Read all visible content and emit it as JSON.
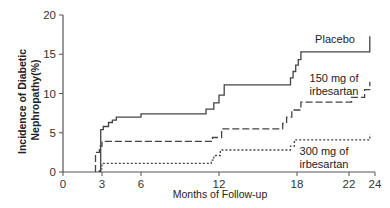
{
  "chart_data": {
    "type": "line",
    "subtype": "step (Kaplan-Meier cumulative incidence)",
    "title": "",
    "xlabel": "Months of Follow-up",
    "ylabel": [
      "Incidence of Diabetic",
      "Nephropathy(%)"
    ],
    "xlim": [
      0,
      24
    ],
    "ylim": [
      0,
      20
    ],
    "x_ticks": [
      0,
      3,
      6,
      12,
      18,
      22,
      24
    ],
    "y_ticks": [
      0,
      5,
      10,
      15,
      20
    ],
    "grid": false,
    "legend_position": "inline labels near curves",
    "series": [
      {
        "name": "Placebo",
        "style": "solid",
        "color": "#444444",
        "label_lines": [
          "Placebo"
        ],
        "label_pos": {
          "x": 335,
          "y": 43
        },
        "points": [
          [
            2.9,
            0
          ],
          [
            2.9,
            5.4
          ],
          [
            3.1,
            5.4
          ],
          [
            3.1,
            5.8
          ],
          [
            3.5,
            5.8
          ],
          [
            3.5,
            6.3
          ],
          [
            3.8,
            6.3
          ],
          [
            3.8,
            6.6
          ],
          [
            4.1,
            6.6
          ],
          [
            4.1,
            7.0
          ],
          [
            6.0,
            7.0
          ],
          [
            6.0,
            7.4
          ],
          [
            11.0,
            7.4
          ],
          [
            11.0,
            8.0
          ],
          [
            11.6,
            8.0
          ],
          [
            11.6,
            8.8
          ],
          [
            12.0,
            8.8
          ],
          [
            12.0,
            9.8
          ],
          [
            12.4,
            9.8
          ],
          [
            12.4,
            11.1
          ],
          [
            17.5,
            11.1
          ],
          [
            17.5,
            12.0
          ],
          [
            17.7,
            12.0
          ],
          [
            17.7,
            12.8
          ],
          [
            17.9,
            12.8
          ],
          [
            17.9,
            13.6
          ],
          [
            18.1,
            13.6
          ],
          [
            18.1,
            14.3
          ],
          [
            18.3,
            14.3
          ],
          [
            18.3,
            15.3
          ],
          [
            23.6,
            15.3
          ],
          [
            23.6,
            17.3
          ]
        ]
      },
      {
        "name": "150 mg of irbesartan",
        "style": "dashed",
        "color": "#444444",
        "label_lines": [
          "150 mg of",
          "irbesartan"
        ],
        "label_pos": {
          "x": 334,
          "y": 82
        },
        "points": [
          [
            2.5,
            0
          ],
          [
            2.5,
            2.5
          ],
          [
            2.8,
            2.5
          ],
          [
            2.8,
            3.3
          ],
          [
            3.0,
            3.3
          ],
          [
            3.0,
            3.9
          ],
          [
            11.5,
            3.9
          ],
          [
            11.5,
            4.4
          ],
          [
            12.2,
            4.4
          ],
          [
            12.2,
            5.5
          ],
          [
            16.9,
            5.5
          ],
          [
            16.9,
            6.2
          ],
          [
            17.2,
            6.2
          ],
          [
            17.2,
            7.0
          ],
          [
            17.6,
            7.0
          ],
          [
            17.6,
            7.9
          ],
          [
            18.3,
            7.9
          ],
          [
            18.3,
            8.9
          ],
          [
            22.2,
            8.9
          ],
          [
            22.2,
            9.5
          ],
          [
            23.2,
            9.5
          ],
          [
            23.2,
            10.5
          ],
          [
            23.6,
            10.5
          ],
          [
            23.6,
            11.5
          ]
        ]
      },
      {
        "name": "300 mg of irbesartan",
        "style": "dotted",
        "color": "#444444",
        "label_lines": [
          "300 mg of",
          "irbesartan"
        ],
        "label_pos": {
          "x": 324,
          "y": 155
        },
        "points": [
          [
            2.8,
            0
          ],
          [
            2.8,
            0.4
          ],
          [
            3.0,
            0.4
          ],
          [
            3.0,
            1.1
          ],
          [
            11.4,
            1.1
          ],
          [
            11.4,
            1.5
          ],
          [
            11.6,
            1.5
          ],
          [
            11.6,
            2.1
          ],
          [
            12.1,
            2.1
          ],
          [
            12.1,
            2.8
          ],
          [
            17.5,
            2.8
          ],
          [
            17.5,
            3.3
          ],
          [
            17.8,
            3.3
          ],
          [
            17.8,
            4.1
          ],
          [
            23.6,
            4.1
          ],
          [
            23.6,
            4.8
          ]
        ]
      }
    ]
  },
  "layout": {
    "x0_px": 63,
    "px_per_month": 13.0,
    "y0_px": 172,
    "px_per_unit": 7.85
  }
}
